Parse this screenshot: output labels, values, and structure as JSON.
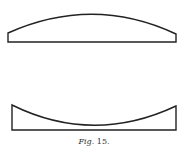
{
  "figure": {
    "caption_prefix": "Fig.",
    "caption_number": "15.",
    "shapes": [
      {
        "name": "plano-convex-lens",
        "description": "Lens with flat bottom and convex top surface"
      },
      {
        "name": "plano-concave-lens",
        "description": "Lens with flat bottom and concave top surface"
      }
    ],
    "stroke_color": "#222222"
  }
}
